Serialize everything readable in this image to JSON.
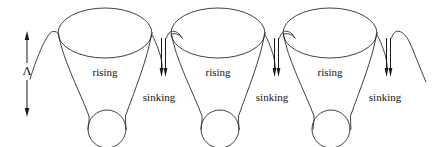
{
  "figure": {
    "name": "convection-cell-diagram",
    "width": 438,
    "height": 147,
    "background_color": "#ffffff",
    "line_color": "#2b2b2b",
    "text_color": "#111111"
  },
  "scale_marker": {
    "symbol": "Λ",
    "arrow_name": "vertical-double-arrow",
    "x": 27,
    "top_y": 32,
    "bottom_y": 116
  },
  "cells": [
    {
      "id": "cell-1",
      "rising_label": "rising",
      "sinking_label": "sinking",
      "top_ellipse": {
        "cx": 105,
        "cy": 33,
        "rx": 47,
        "ry": 25
      },
      "bottom_circle": {
        "cx": 107,
        "cy": 129,
        "r": 19
      },
      "rising_label_pos": {
        "x": 105,
        "y": 73
      },
      "sinking_label_pos": {
        "x": 159,
        "y": 98
      },
      "down_arrow_x": 163
    },
    {
      "id": "cell-2",
      "rising_label": "rising",
      "sinking_label": "sinking",
      "top_ellipse": {
        "cx": 218,
        "cy": 33,
        "rx": 47,
        "ry": 25
      },
      "bottom_circle": {
        "cx": 220,
        "cy": 129,
        "r": 19
      },
      "rising_label_pos": {
        "x": 218,
        "y": 73
      },
      "sinking_label_pos": {
        "x": 272,
        "y": 98
      },
      "down_arrow_x": 276
    },
    {
      "id": "cell-3",
      "rising_label": "rising",
      "sinking_label": "sinking",
      "top_ellipse": {
        "cx": 330,
        "cy": 33,
        "rx": 47,
        "ry": 25
      },
      "bottom_circle": {
        "cx": 331,
        "cy": 129,
        "r": 19
      },
      "rising_label_pos": {
        "x": 330,
        "y": 73
      },
      "sinking_label_pos": {
        "x": 385,
        "y": 98
      },
      "down_arrow_x": 388
    }
  ],
  "labels": {
    "rising_1": "rising",
    "rising_2": "rising",
    "rising_3": "rising",
    "sinking_1": "sinking",
    "sinking_2": "sinking",
    "sinking_3": "sinking",
    "lambda": "Λ"
  }
}
